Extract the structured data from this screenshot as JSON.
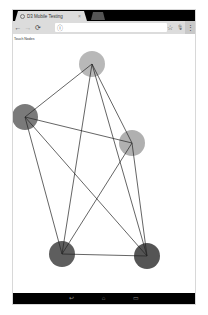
{
  "browser": {
    "tab": {
      "title": "D3 Mobile Testing",
      "close_icon": "close-icon"
    },
    "toolbar": {
      "back_icon": "←",
      "forward_icon": "→",
      "reload_icon": "⟳",
      "info_icon": "ⓘ",
      "bookmark_icon": "☆",
      "mic_icon": "🎙",
      "menu_icon": "⋮",
      "url": ""
    }
  },
  "page": {
    "label": "Touch Nodes",
    "graph": {
      "nodes": [
        {
          "id": "A",
          "cx": 79,
          "cy": 30,
          "r": 13,
          "color": "#b8b8b8"
        },
        {
          "id": "B",
          "cx": 12,
          "cy": 83,
          "r": 13,
          "color": "#7a7a7a"
        },
        {
          "id": "C",
          "cx": 119,
          "cy": 109,
          "r": 13,
          "color": "#b0b0b0"
        },
        {
          "id": "D",
          "cx": 49,
          "cy": 220,
          "r": 13,
          "color": "#5e5e5e"
        },
        {
          "id": "E",
          "cx": 134,
          "cy": 222,
          "r": 13,
          "color": "#555555"
        }
      ],
      "edges": [
        [
          "A",
          "B"
        ],
        [
          "A",
          "C"
        ],
        [
          "A",
          "D"
        ],
        [
          "A",
          "E"
        ],
        [
          "B",
          "C"
        ],
        [
          "B",
          "D"
        ],
        [
          "B",
          "E"
        ],
        [
          "C",
          "D"
        ],
        [
          "C",
          "E"
        ],
        [
          "D",
          "E"
        ]
      ],
      "edge_color": "#222222"
    }
  },
  "navbar": {
    "back": "↩",
    "home": "⌂",
    "recents": "▭"
  }
}
